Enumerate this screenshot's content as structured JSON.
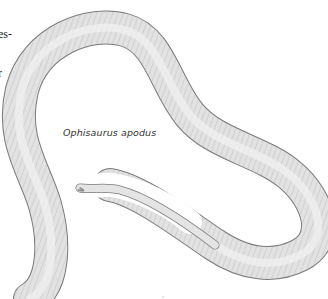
{
  "page": {
    "cropped_text_lines": [
      "es-",
      "r"
    ],
    "caption": "Ophisaurus apodus"
  },
  "illustration": {
    "subject": "legless-lizard-drawing",
    "colors": {
      "body_fill": "#e4e4e4",
      "body_outline": "#7a7a7a",
      "scale_lines": "#9a9a9a",
      "background": "#ffffff"
    }
  }
}
